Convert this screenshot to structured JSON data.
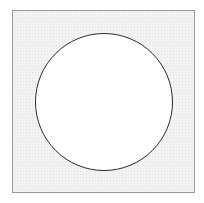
{
  "shape": {
    "frame": {
      "type": "square",
      "fill": "#f3f3f3",
      "border": "#9a9a9a"
    },
    "circle": {
      "type": "circle",
      "fill": "#ffffff",
      "stroke": "#2b2b2b"
    }
  }
}
